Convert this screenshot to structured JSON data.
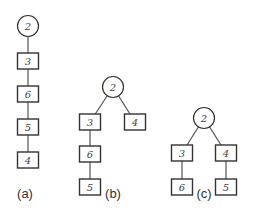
{
  "diagrams": [
    {
      "label": "(a)",
      "root": "2",
      "nodes": [
        {
          "id": "a2",
          "value": "2",
          "shape": "circle"
        },
        {
          "id": "a3",
          "value": "3",
          "shape": "box"
        },
        {
          "id": "a6",
          "value": "6",
          "shape": "box"
        },
        {
          "id": "a5",
          "value": "5",
          "shape": "box"
        },
        {
          "id": "a4",
          "value": "4",
          "shape": "box"
        }
      ],
      "edges": [
        [
          "a2",
          "a3"
        ],
        [
          "a3",
          "a6"
        ],
        [
          "a6",
          "a5"
        ],
        [
          "a5",
          "a4"
        ]
      ]
    },
    {
      "label": "(b)",
      "root": "2",
      "nodes": [
        {
          "id": "b2",
          "value": "2",
          "shape": "circle"
        },
        {
          "id": "b3",
          "value": "3",
          "shape": "box"
        },
        {
          "id": "b4",
          "value": "4",
          "shape": "box"
        },
        {
          "id": "b6",
          "value": "6",
          "shape": "box"
        },
        {
          "id": "b5",
          "value": "5",
          "shape": "box"
        }
      ],
      "edges": [
        [
          "b2",
          "b3"
        ],
        [
          "b2",
          "b4"
        ],
        [
          "b3",
          "b6"
        ],
        [
          "b6",
          "b5"
        ]
      ]
    },
    {
      "label": "(c)",
      "root": "2",
      "nodes": [
        {
          "id": "c2",
          "value": "2",
          "shape": "circle"
        },
        {
          "id": "c3",
          "value": "3",
          "shape": "box"
        },
        {
          "id": "c4",
          "value": "4",
          "shape": "box"
        },
        {
          "id": "c6",
          "value": "6",
          "shape": "box"
        },
        {
          "id": "c5",
          "value": "5",
          "shape": "box"
        }
      ],
      "edges": [
        [
          "c2",
          "c3"
        ],
        [
          "c2",
          "c4"
        ],
        [
          "c3",
          "c6"
        ],
        [
          "c4",
          "c5"
        ]
      ]
    }
  ]
}
